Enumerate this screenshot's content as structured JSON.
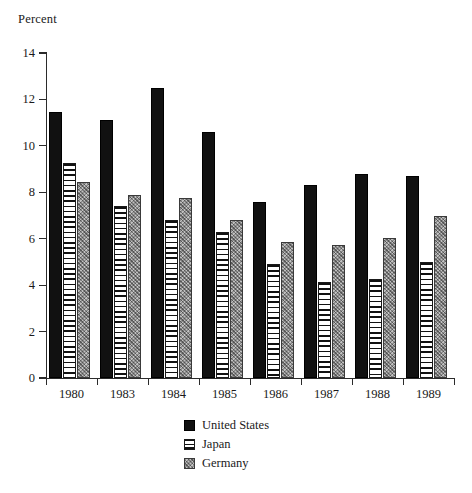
{
  "chart_data": {
    "type": "bar",
    "title": "",
    "subtitle": "",
    "xlabel": "",
    "ylabel": "Percent",
    "ylim": [
      0,
      14
    ],
    "yticks": [
      0,
      2,
      4,
      6,
      8,
      10,
      12,
      14
    ],
    "grid": false,
    "legend_position": "bottom-center",
    "categories": [
      "1980",
      "1983",
      "1984",
      "1985",
      "1986",
      "1987",
      "1988",
      "1989"
    ],
    "series": [
      {
        "name": "United States",
        "pattern": "solid-black",
        "color": "#111111",
        "values": [
          11.45,
          11.1,
          12.5,
          10.6,
          7.6,
          8.3,
          8.8,
          8.7
        ]
      },
      {
        "name": "Japan",
        "pattern": "horizontal-stripes",
        "color": "#ffffff",
        "values": [
          9.25,
          7.4,
          6.8,
          6.3,
          4.9,
          4.15,
          4.25,
          5.0
        ]
      },
      {
        "name": "Germany",
        "pattern": "stipple-gray",
        "color": "#8f8f8f",
        "values": [
          8.45,
          7.9,
          7.75,
          6.8,
          5.85,
          5.75,
          6.05,
          7.0
        ]
      }
    ]
  },
  "legend": {
    "items": [
      {
        "label": "United States",
        "swatch": "solid-black-swatch"
      },
      {
        "label": "Japan",
        "swatch": "horizontal-stripe-swatch"
      },
      {
        "label": "Germany",
        "swatch": "gray-stipple-swatch"
      }
    ]
  }
}
